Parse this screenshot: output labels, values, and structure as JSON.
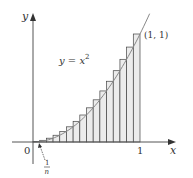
{
  "chart_data": {
    "type": "bar",
    "title": "",
    "curve": "y = x^2",
    "n": 16,
    "x": [
      0.0625,
      0.125,
      0.1875,
      0.25,
      0.3125,
      0.375,
      0.4375,
      0.5,
      0.5625,
      0.625,
      0.6875,
      0.75,
      0.8125,
      0.875,
      0.9375,
      1.0
    ],
    "values": [
      0.0039,
      0.0156,
      0.0352,
      0.0625,
      0.0977,
      0.1406,
      0.1914,
      0.25,
      0.3164,
      0.3906,
      0.4727,
      0.5625,
      0.6602,
      0.7656,
      0.8789,
      1.0
    ],
    "xlabel": "x",
    "ylabel": "y",
    "xlim": [
      0,
      1
    ],
    "ylim": [
      0,
      1
    ],
    "grid": false,
    "annotations": {
      "curve_label": "y = x",
      "curve_label_sup": "2",
      "point_label": "(1, 1)",
      "origin_label": "0",
      "x_tick_label": "1",
      "width_label_num": "1",
      "width_label_den": "n"
    },
    "colors": {
      "bar_fill": "#ececec",
      "bar_stroke": "#444444",
      "axis": "#555555",
      "curve": "#888888"
    }
  }
}
